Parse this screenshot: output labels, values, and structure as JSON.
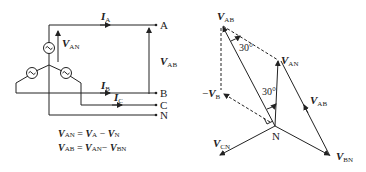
{
  "circuit": {
    "nodes": [
      "A",
      "B",
      "C",
      "N"
    ],
    "currents": [
      {
        "sym": "I",
        "sub": "A"
      },
      {
        "sym": "I",
        "sub": "B"
      },
      {
        "sym": "I",
        "sub": "C"
      }
    ],
    "voltages": {
      "van": {
        "sym": "V",
        "sub": "AN"
      },
      "vab": {
        "sym": "V",
        "sub": "AB"
      }
    },
    "equations": [
      {
        "lhs_sym": "V",
        "lhs_sub": "AN",
        "op1_sym": "V",
        "op1_sub": "A",
        "op2_sym": "V",
        "op2_sub": "N"
      },
      {
        "lhs_sym": "V",
        "lhs_sub": "AB",
        "op1_sym": "V",
        "op1_sub": "AN",
        "op2_sym": "V",
        "op2_sub": "BN"
      }
    ]
  },
  "phasor": {
    "labels": {
      "vab": {
        "sym": "V",
        "sub": "AB"
      },
      "van": {
        "sym": "V",
        "sub": "AN"
      },
      "vab2": {
        "sym": "V",
        "sub": "AB"
      },
      "negvb": {
        "prefix": "−",
        "sym": "V",
        "sub": "B"
      },
      "vcn": {
        "sym": "V",
        "sub": "CN"
      },
      "vbn": {
        "sym": "V",
        "sub": "BN"
      },
      "n": "N"
    },
    "angles": [
      "30°",
      "30°"
    ]
  }
}
